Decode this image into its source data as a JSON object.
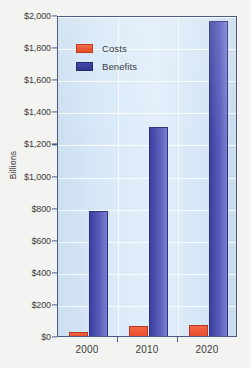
{
  "chart_data": {
    "type": "bar",
    "title": "",
    "xlabel": "",
    "ylabel": "Billions",
    "categories": [
      "2000",
      "2010",
      "2020"
    ],
    "series": [
      {
        "name": "Costs",
        "values": [
          25,
          65,
          70
        ],
        "color": "#ee5733"
      },
      {
        "name": "Benefits",
        "values": [
          780,
          1305,
          1960
        ],
        "color": "#3b3f9e"
      }
    ],
    "ylim": [
      0,
      2000
    ],
    "ytick_values": [
      0,
      200,
      400,
      600,
      800,
      1000,
      1200,
      1400,
      1600,
      1800,
      2000
    ],
    "ytick_labels": [
      "$0",
      "$200",
      "$400",
      "$600",
      "$800",
      "$1,000",
      "$1,200",
      "$1,400",
      "$1,600",
      "$1,800",
      "$2,000"
    ],
    "grid": true,
    "legend_position": "top-left"
  },
  "legend": {
    "items": [
      {
        "label": "Costs"
      },
      {
        "label": "Benefits"
      }
    ]
  },
  "axis": {
    "y_title": "Billions"
  }
}
